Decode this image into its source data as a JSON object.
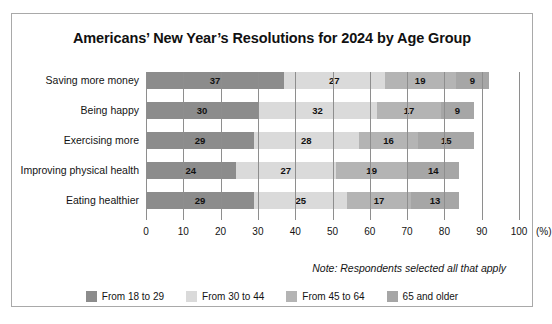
{
  "chart_data": {
    "type": "bar",
    "subtype": "stacked-horizontal",
    "title": "Americans’ New Year’s Resolutions for 2024 by Age Group",
    "xlabel": "(%)",
    "ylabel": "",
    "xlim": [
      0,
      100
    ],
    "xticks": [
      0,
      10,
      20,
      30,
      40,
      50,
      60,
      70,
      80,
      90,
      100
    ],
    "xtick_labels": [
      "0",
      "10",
      "20",
      "30",
      "40",
      "50",
      "60",
      "70",
      "80",
      "90",
      "100"
    ],
    "grid": "vertical",
    "legend_position": "bottom-center",
    "categories": [
      "Saving more money",
      "Being happy",
      "Exercising more",
      "Improving physical health",
      "Eating healthier"
    ],
    "series": [
      {
        "name": "From 18 to 29",
        "color": "#8c8c8c",
        "values": [
          37,
          30,
          29,
          24,
          29
        ]
      },
      {
        "name": "From 30 to 44",
        "color": "#dadada",
        "values": [
          27,
          32,
          28,
          27,
          25
        ]
      },
      {
        "name": "From 45 to 64",
        "color": "#b4b4b4",
        "values": [
          19,
          17,
          16,
          19,
          17
        ]
      },
      {
        "name": "65 and older",
        "color": "#a6a6a6",
        "values": [
          9,
          9,
          15,
          14,
          13
        ]
      }
    ],
    "totals": [
      92,
      88,
      88,
      84,
      84
    ],
    "annotations": [
      "Note: Respondents selected all that apply"
    ]
  },
  "note": "Note: Respondents selected all that apply",
  "axis_unit": "(%)",
  "colors": {
    "frame_border": "#a9a9a9",
    "gridline": "#8e8e8e",
    "background": "#ffffff",
    "text": "#131313"
  }
}
